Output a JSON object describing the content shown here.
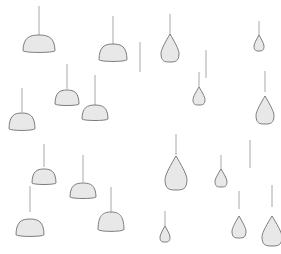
{
  "scene": {
    "title": "Hanging Shapes",
    "width": 281,
    "height": 254,
    "background_color": "#ffffff",
    "blob_fill_color": "#e8e8e8",
    "blob_stroke_color": "#7d7d7d",
    "thread_color": "#a8a8a8",
    "thread_width": 1,
    "shape_count": 21,
    "dome_count": 12,
    "teardrop_count": 9
  },
  "shapes": [
    {
      "id": "shape-1",
      "kind": "dome",
      "anchor_x": 39,
      "anchor_y": 6,
      "thread_bottom": 37,
      "cx": 39,
      "cy": 44,
      "rx": 16,
      "ry": 9
    },
    {
      "id": "shape-2",
      "kind": "dome",
      "anchor_x": 113,
      "anchor_y": 16,
      "thread_bottom": 46,
      "cx": 113,
      "cy": 53,
      "rx": 14,
      "ry": 9
    },
    {
      "id": "shape-3",
      "kind": "teardrop",
      "anchor_x": 170,
      "anchor_y": 14,
      "thread_bottom": 36,
      "cx": 170,
      "cy": 48,
      "rx": 9,
      "ry": 14
    },
    {
      "id": "shape-4",
      "kind": "teardrop",
      "anchor_x": 259,
      "anchor_y": 21,
      "thread_bottom": 36,
      "cx": 259,
      "cy": 43,
      "rx": 5,
      "ry": 8
    },
    {
      "id": "shape-5",
      "kind": "dome",
      "anchor_x": 67,
      "anchor_y": 64,
      "thread_bottom": 89,
      "cx": 67,
      "cy": 98,
      "rx": 12,
      "ry": 8
    },
    {
      "id": "shape-6",
      "kind": "dome",
      "anchor_x": 95,
      "anchor_y": 75,
      "thread_bottom": 105,
      "cx": 95,
      "cy": 113,
      "rx": 13,
      "ry": 8
    },
    {
      "id": "shape-7",
      "kind": "teardrop",
      "anchor_x": 199,
      "anchor_y": 72,
      "thread_bottom": 88,
      "cx": 199,
      "cy": 96,
      "rx": 6,
      "ry": 9
    },
    {
      "id": "shape-8",
      "kind": "teardrop",
      "anchor_x": 265,
      "anchor_y": 71,
      "thread_bottom": 92,
      "cx": 265,
      "cy": 110,
      "rx": 9,
      "ry": 14
    },
    {
      "id": "shape-9",
      "kind": "dome",
      "anchor_x": 22,
      "anchor_y": 88,
      "thread_bottom": 112,
      "cx": 22,
      "cy": 122,
      "rx": 13,
      "ry": 9
    },
    {
      "id": "shape-10",
      "kind": "dome",
      "anchor_x": 44,
      "anchor_y": 144,
      "thread_bottom": 167,
      "cx": 44,
      "cy": 177,
      "rx": 12,
      "ry": 8
    },
    {
      "id": "shape-11",
      "kind": "teardrop",
      "anchor_x": 176,
      "anchor_y": 134,
      "thread_bottom": 155,
      "cx": 176,
      "cy": 173,
      "rx": 11,
      "ry": 17
    },
    {
      "id": "shape-12",
      "kind": "teardrop",
      "anchor_x": 221,
      "anchor_y": 155,
      "thread_bottom": 171,
      "cx": 221,
      "cy": 178,
      "rx": 6,
      "ry": 9
    },
    {
      "id": "shape-13",
      "kind": "dome",
      "anchor_x": 83,
      "anchor_y": 155,
      "thread_bottom": 182,
      "cx": 83,
      "cy": 191,
      "rx": 13,
      "ry": 8
    },
    {
      "id": "shape-14",
      "kind": "dome",
      "anchor_x": 30,
      "anchor_y": 186,
      "thread_bottom": 212,
      "cx": 30,
      "cy": 228,
      "rx": 14,
      "ry": 9
    },
    {
      "id": "shape-15",
      "kind": "dome",
      "anchor_x": 111,
      "anchor_y": 187,
      "thread_bottom": 213,
      "cx": 111,
      "cy": 222,
      "rx": 13,
      "ry": 10
    },
    {
      "id": "shape-16",
      "kind": "teardrop",
      "anchor_x": 165,
      "anchor_y": 211,
      "thread_bottom": 226,
      "cx": 165,
      "cy": 234,
      "rx": 5,
      "ry": 8
    },
    {
      "id": "shape-17",
      "kind": "teardrop",
      "anchor_x": 239,
      "anchor_y": 191,
      "thread_bottom": 209,
      "cx": 239,
      "cy": 227,
      "rx": 7,
      "ry": 11
    },
    {
      "id": "shape-18",
      "kind": "teardrop",
      "anchor_x": 272,
      "anchor_y": 185,
      "thread_bottom": 207,
      "cx": 272,
      "cy": 231,
      "rx": 10,
      "ry": 15
    },
    {
      "id": "shape-19",
      "kind": "dome",
      "anchor_x": 140,
      "anchor_y": 42,
      "thread_bottom": 72,
      "cx": 140,
      "cy": 80,
      "rx": 0,
      "ry": 0
    },
    {
      "id": "shape-20",
      "kind": "dome",
      "anchor_x": 206,
      "anchor_y": 50,
      "thread_bottom": 78,
      "cx": 206,
      "cy": 86,
      "rx": 0,
      "ry": 0
    },
    {
      "id": "shape-21",
      "kind": "dome",
      "anchor_x": 250,
      "anchor_y": 140,
      "thread_bottom": 168,
      "cx": 250,
      "cy": 176,
      "rx": 0,
      "ry": 0
    }
  ]
}
